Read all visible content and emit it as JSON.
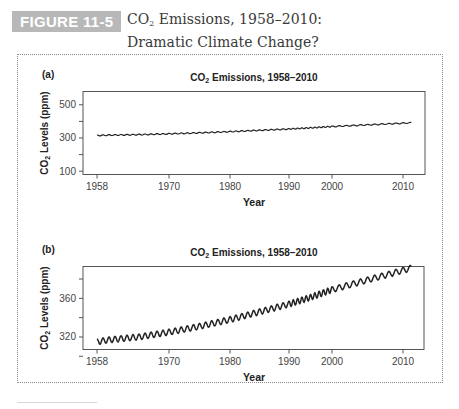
{
  "figure": {
    "badge": "FIGURE 11-5",
    "title_line1_prefix": "CO",
    "title_line1_sub": "2",
    "title_line1_suffix": " Emissions, 1958–2010:",
    "title_line2": "Dramatic Climate Change?",
    "colors": {
      "badge_bg": "#b8b8b8",
      "badge_text": "#ffffff",
      "title_text": "#3a3a3a",
      "line": "#222222",
      "axes": "#444444"
    }
  },
  "chart_data": [
    {
      "panel_label": "(a)",
      "type": "line",
      "title": "CO2 Emissions, 1958–2010",
      "title_prefix": "CO",
      "title_sub": "2",
      "title_suffix": " Emissions, 1958–2010",
      "xlabel": "Year",
      "ylabel": "CO2 Levels (ppm)",
      "ylabel_prefix": "CO",
      "ylabel_sub": "2",
      "ylabel_suffix": " Levels (ppm)",
      "x_ticks": [
        1958,
        1970,
        1980,
        1990,
        2000,
        2010
      ],
      "y_ticks": [
        100,
        200,
        300,
        400,
        500
      ],
      "y_tick_labels": [
        "100",
        "",
        "300",
        "",
        "500"
      ],
      "ylim": [
        80,
        580
      ],
      "xlim": [
        1958,
        2010
      ],
      "grid": false,
      "series": [
        {
          "name": "Atmospheric CO2 (ppm)",
          "x": [
            1958,
            1960,
            1965,
            1970,
            1975,
            1980,
            1985,
            1990,
            1995,
            2000,
            2005,
            2010
          ],
          "values": [
            315,
            317,
            320,
            325,
            331,
            338,
            346,
            354,
            361,
            369,
            379,
            389
          ],
          "seasonal_amplitude": 3
        }
      ]
    },
    {
      "panel_label": "(b)",
      "type": "line",
      "title": "CO2 Emissions, 1958–2010",
      "title_prefix": "CO",
      "title_sub": "2",
      "title_suffix": " Emissions, 1958–2010",
      "xlabel": "Year",
      "ylabel": "CO2 Levels (ppm)",
      "ylabel_prefix": "CO",
      "ylabel_sub": "2",
      "ylabel_suffix": " Levels (ppm)",
      "x_ticks": [
        1958,
        1970,
        1980,
        1990,
        2000,
        2010
      ],
      "y_ticks": [
        300,
        320,
        340,
        360,
        380
      ],
      "y_tick_labels": [
        "",
        "320",
        "",
        "360",
        ""
      ],
      "ylim": [
        307,
        393
      ],
      "xlim": [
        1958,
        2010
      ],
      "grid": false,
      "series": [
        {
          "name": "Atmospheric CO2 (ppm)",
          "x": [
            1958,
            1960,
            1965,
            1970,
            1975,
            1980,
            1985,
            1990,
            1995,
            2000,
            2005,
            2010
          ],
          "values": [
            315,
            317,
            320,
            325,
            331,
            338,
            346,
            354,
            361,
            369,
            379,
            389
          ],
          "seasonal_amplitude": 3
        }
      ]
    }
  ]
}
